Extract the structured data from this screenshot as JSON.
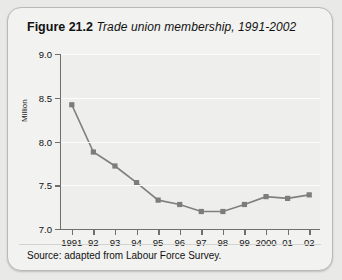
{
  "figure": {
    "number_label": "Figure 21.2",
    "caption": "Trade union membership, 1991-2002",
    "source": "Source: adapted from Labour Force Survey."
  },
  "colors": {
    "line": "#808080",
    "marker": "#7c7c7c",
    "axis": "#6f6f6f",
    "plot_background": "#eeeeec",
    "gridline": "#fcfcfc",
    "card_background": "#f2f2f0"
  },
  "chart_data": {
    "type": "line",
    "title": "Trade union membership, 1991-2002",
    "xlabel": "",
    "ylabel": "Million",
    "categories": [
      "1991",
      "92",
      "93",
      "94",
      "95",
      "96",
      "97",
      "98",
      "99",
      "2000",
      "01",
      "02"
    ],
    "values": [
      8.42,
      7.88,
      7.72,
      7.53,
      7.33,
      7.28,
      7.2,
      7.2,
      7.28,
      7.37,
      7.35,
      7.39
    ],
    "ylim": [
      7.0,
      9.0
    ],
    "ytick_step": 0.5,
    "yticks": [
      "9.0",
      "8.5",
      "8.0",
      "7.5",
      "7.0"
    ],
    "ytick_values": [
      9.0,
      8.5,
      8.0,
      7.5,
      7.0
    ],
    "grid": true,
    "legend": "none",
    "markers": "square"
  }
}
